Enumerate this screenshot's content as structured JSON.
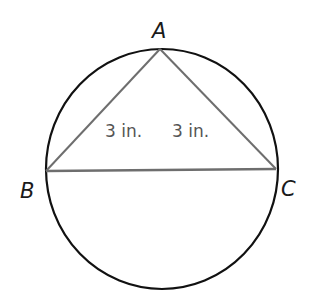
{
  "diagram": {
    "type": "geometry",
    "colors": {
      "circle": "#111111",
      "triangle": "#6e6e6e",
      "vertex_labels": "#1a1a1a",
      "measure_labels": "#555555"
    },
    "circle": {
      "cx": 162,
      "cy": 169,
      "rx": 116,
      "ry": 120
    },
    "vertices": [
      {
        "name": "A",
        "x": 160,
        "y": 49,
        "label": "A",
        "label_x": 152,
        "label_y": 38
      },
      {
        "name": "B",
        "x": 46,
        "y": 171,
        "label": "B",
        "label_x": 20,
        "label_y": 198
      },
      {
        "name": "C",
        "x": 276,
        "y": 169,
        "label": "C",
        "label_x": 281,
        "label_y": 196
      }
    ],
    "segments": [
      {
        "from": "A",
        "to": "B",
        "length_label": "3 in."
      },
      {
        "from": "A",
        "to": "C",
        "length_label": "3 in."
      },
      {
        "from": "B",
        "to": "C",
        "length_label": ""
      }
    ],
    "measure_labels": [
      {
        "text": "3 in.",
        "x": 105,
        "y": 137
      },
      {
        "text": "3 in.",
        "x": 172,
        "y": 137
      }
    ]
  }
}
